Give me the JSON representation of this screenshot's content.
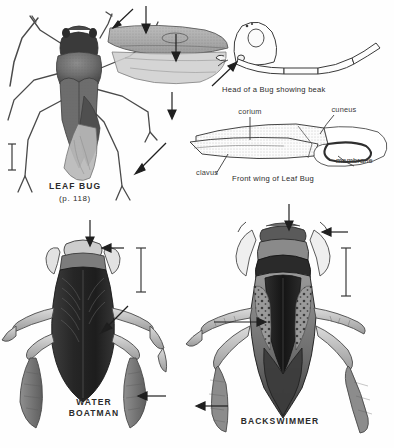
{
  "plate": {
    "title": "Plate of true bugs (Hemiptera)",
    "background_color": "#ffffff",
    "ink_color": "#2b2b2b"
  },
  "figures": [
    {
      "id": "leaf-bug",
      "name": "LEAF BUG",
      "page_ref": "(p. 118)",
      "description": "Dorsal view of a leaf bug (plant bug) with one front wing spread to the right",
      "label_x": 75,
      "label_y": 186,
      "page_ref_y": 197
    },
    {
      "id": "head-of-bug",
      "caption": "Head of a Bug showing beak",
      "description": "Lateral line drawing of a bug head with segmented beak extending back",
      "label_x": 288,
      "label_y": 91
    },
    {
      "id": "front-wing",
      "caption": "Front wing of Leaf Bug",
      "description": "Line diagram of the hemelytron of a leaf bug",
      "label_x": 283,
      "label_y": 180
    },
    {
      "id": "water-boatman",
      "name": "WATER BOATMAN",
      "name_line1": "WATER",
      "name_line2": "BOATMAN",
      "description": "Dorsal view of a water boatman with oar-like hind legs",
      "label_x": 95,
      "label_y": 402
    },
    {
      "id": "backswimmer",
      "name": "BACKSWIMMER",
      "description": "Dorsal view of a backswimmer with long fringed hind legs",
      "label_x": 280,
      "label_y": 421
    }
  ],
  "wing_parts": [
    {
      "label": "corium",
      "x": 244,
      "y": 115,
      "leader_to_x": 253,
      "leader_to_y": 142
    },
    {
      "label": "cuneus",
      "x": 340,
      "y": 113,
      "leader_to_x": 328,
      "leader_to_y": 132
    },
    {
      "label": "membrane",
      "x": 356,
      "y": 159,
      "leader_to_x": 345,
      "leader_to_y": 152
    },
    {
      "label": "clavus",
      "x": 207,
      "y": 172,
      "leader_to_x": 224,
      "leader_to_y": 156
    }
  ],
  "pointer_arrows": [
    {
      "id": "arrow-leafbug-antenna",
      "target": "antenna"
    },
    {
      "id": "arrow-leafbug-pronotum",
      "target": "pronotum"
    },
    {
      "id": "arrow-leafbug-corium",
      "target": "corium of front wing"
    },
    {
      "id": "arrow-leafbug-membrane",
      "target": "membrane of front wing"
    },
    {
      "id": "arrow-leafbug-leg",
      "target": "hind leg"
    },
    {
      "id": "arrow-head-beak",
      "target": "beak"
    },
    {
      "id": "arrow-boatman-head",
      "target": "head"
    },
    {
      "id": "arrow-boatman-foreleg",
      "target": "scoop-shaped foreleg"
    },
    {
      "id": "arrow-boatman-pronotum",
      "target": "pronotum stripes"
    },
    {
      "id": "arrow-boatman-hindleg",
      "target": "oar-like hind leg"
    },
    {
      "id": "arrow-backswimmer-head",
      "target": "head"
    },
    {
      "id": "arrow-backswimmer-foreleg",
      "target": "foreleg"
    },
    {
      "id": "arrow-backswimmer-keel",
      "target": "keeled back"
    },
    {
      "id": "arrow-backswimmer-hindleg",
      "target": "fringed hind leg"
    }
  ],
  "scale_bars": [
    {
      "id": "scale-bar-leaf-bug",
      "orientation": "vertical"
    },
    {
      "id": "scale-bar-boatman",
      "orientation": "vertical"
    },
    {
      "id": "scale-bar-backswimmer",
      "orientation": "vertical"
    }
  ]
}
